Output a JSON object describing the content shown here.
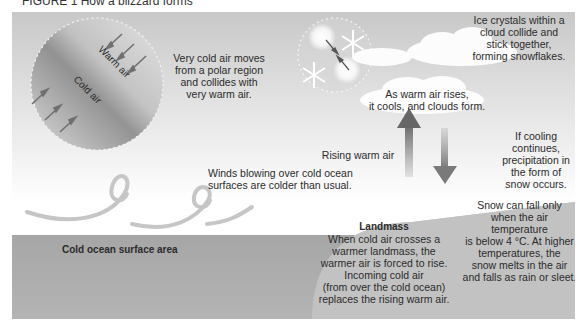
{
  "figure": {
    "title": "FIGURE 1 How a blizzard forms"
  },
  "labels": {
    "warm_air": "Warm air",
    "cold_air": "Cold air",
    "polar_collision": [
      "Very cold air moves",
      "from a polar region",
      "and collides with",
      "very warm air."
    ],
    "ice_crystals": [
      "Ice crystals within a",
      "cloud collide and",
      "stick together,",
      "forming snowflakes."
    ],
    "clouds_form": [
      "As warm air rises,",
      "it cools, and clouds form."
    ],
    "rising_warm_air": "Rising warm air",
    "cooling_continues": [
      "If cooling",
      "continues,",
      "precipitation in",
      "the form of",
      "snow occurs."
    ],
    "winds_ocean": [
      "Winds blowing over cold ocean",
      "surfaces are colder than usual."
    ],
    "cold_ocean_title": "Cold ocean surface area",
    "landmass_title": "Landmass",
    "landmass_body": [
      "When cold air crosses a",
      "warmer landmass, the",
      "warmer air is forced to rise.",
      "Incoming cold air",
      "(from over the cold ocean)",
      "replaces the rising warm air."
    ],
    "snow_temp": [
      "Snow can fall only",
      "when the air temperature",
      "is below 4 °C. At higher",
      "temperatures, the",
      "snow melts in the air",
      "and falls as rain or sleet."
    ]
  },
  "icons": {
    "collision_circle": "air-mass-collision-circle",
    "snowflake_circle": "snowflake-formation-circle",
    "up_arrow": "rising-air-arrow",
    "down_arrow": "falling-snow-arrow",
    "wind_swirls": "wind-swirl",
    "clouds": "cloud"
  },
  "colors": {
    "arrow": "#6e6e6e",
    "ocean": "#a8a8a8",
    "landmass": "#c4c4c4",
    "text": "#2b2b2b"
  }
}
